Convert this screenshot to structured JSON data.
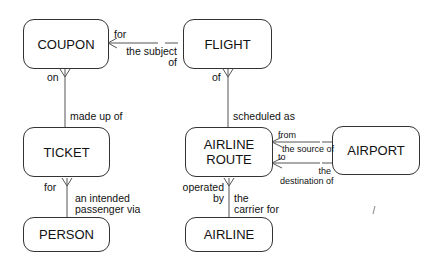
{
  "entities": {
    "coupon": "COUPON",
    "flight": "FLIGHT",
    "ticket": "TICKET",
    "airline_route_line1": "AIRLINE",
    "airline_route_line2": "ROUTE",
    "airport": "AIRPORT",
    "person": "PERSON",
    "airline": "AIRLINE"
  },
  "relationships": {
    "coupon_flight": {
      "near_coupon": "for",
      "near_flight_line1": "the subject",
      "near_flight_line2": "of"
    },
    "coupon_ticket": {
      "near_coupon": "on",
      "near_ticket": "made up of"
    },
    "flight_route": {
      "near_flight": "of",
      "near_route": "scheduled as"
    },
    "ticket_person": {
      "near_ticket": "for",
      "near_person_line1": "an intended",
      "near_person_line2": "passenger via"
    },
    "route_airport_source": {
      "near_route": "from",
      "near_airport": "the source of"
    },
    "route_airport_dest": {
      "near_route": "to",
      "near_airport_line1": "the",
      "near_airport_line2": "destination of"
    },
    "route_airline": {
      "near_route_line1": "operated",
      "near_route_line2": "by",
      "near_airline_line1": "the",
      "near_airline_line2": "carrier for"
    }
  }
}
